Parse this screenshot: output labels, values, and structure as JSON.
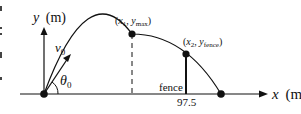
{
  "diagram": {
    "axes": {
      "y_label": "y",
      "y_unit": "(m)",
      "x_label": "x",
      "x_unit": "(m)"
    },
    "launch": {
      "velocity_label": "v",
      "velocity_sub": "0",
      "angle_label": "θ",
      "angle_sub": "0"
    },
    "points": {
      "apex": {
        "open": "(",
        "x": "x",
        "x_sub": "1",
        "sep": ", ",
        "y": "y",
        "y_sub": "max",
        "close": ")"
      },
      "fence_top": {
        "open": "(",
        "x": "x",
        "x_sub": "2",
        "sep": ", ",
        "y": "y",
        "y_sub": "fence",
        "close": ")"
      }
    },
    "fence": {
      "label": "fence",
      "distance": "97.5"
    },
    "colors": {
      "line": "#111111",
      "background": "#ffffff"
    }
  }
}
